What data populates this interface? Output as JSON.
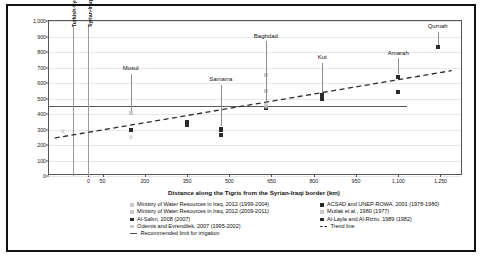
{
  "chart_data": {
    "type": "scatter",
    "title": "",
    "xlabel": "Distance along the Tigris from the Syrian-Iraqi border (km)",
    "ylabel": "TDS (ppm)",
    "xlim": [
      -140,
      1330
    ],
    "ylim": [
      0,
      1000
    ],
    "xticks": [
      0,
      50,
      200,
      350,
      500,
      650,
      800,
      950,
      1100,
      1250
    ],
    "xticklabels": [
      "0",
      "50",
      "200",
      "350",
      "500",
      "650",
      "800",
      "950",
      "1,100",
      "1,250"
    ],
    "yticks": [
      0,
      100,
      200,
      300,
      400,
      500,
      600,
      700,
      800,
      900,
      1000
    ],
    "yticklabels": [
      "0",
      "100",
      "200",
      "300",
      "400",
      "500",
      "600",
      "700",
      "800",
      "900",
      "1,000"
    ],
    "grid": true,
    "legend_position": "below-axis",
    "series": [
      {
        "name": "Ministry of Water Resources in Iraq, 2012 (1999-2004)",
        "marker": "square",
        "color": "#c9c9c9",
        "points": [
          {
            "x": 150,
            "y": 405
          },
          {
            "x": 630,
            "y": 550
          },
          {
            "x": 630,
            "y": 650
          }
        ]
      },
      {
        "name": "Ministry of Water Resources in Iraq, 2012 (2009-2011)",
        "marker": "square",
        "color": "#d8d8d8",
        "points": [
          {
            "x": -90,
            "y": 288
          },
          {
            "x": 150,
            "y": 250
          }
        ]
      },
      {
        "name": "Al-Salim, 2008 (2007)",
        "marker": "square",
        "color": "#2b2b2b",
        "points": [
          {
            "x": 150,
            "y": 300
          },
          {
            "x": 350,
            "y": 330
          },
          {
            "x": 470,
            "y": 300
          },
          {
            "x": 470,
            "y": 265
          },
          {
            "x": 630,
            "y": 455
          },
          {
            "x": 630,
            "y": 440
          },
          {
            "x": 830,
            "y": 520
          },
          {
            "x": 830,
            "y": 500
          },
          {
            "x": 1100,
            "y": 640
          },
          {
            "x": 1100,
            "y": 540
          },
          {
            "x": 1240,
            "y": 830
          }
        ]
      },
      {
        "name": "Odemis and Evrendilek, 2007 (1995-2002)",
        "marker": "square",
        "color": "#cfcfcf",
        "points": [
          {
            "x": 630,
            "y": 460
          }
        ]
      },
      {
        "name": "ACSAD and UNEP-ROWA, 2001 (1978-1980)",
        "marker": "square",
        "color": "#2b2b2b",
        "points": [
          {
            "x": 350,
            "y": 350
          },
          {
            "x": 830,
            "y": 515
          }
        ]
      },
      {
        "name": "Mutlak et al., 1980 (1977)",
        "marker": "square",
        "color": "#b5b5b5",
        "points": [
          {
            "x": 630,
            "y": 445
          }
        ]
      },
      {
        "name": "Al-Layla and Al-Rizzo, 1989 (1982)",
        "marker": "square",
        "color": "#2b2b2b",
        "points": [
          {
            "x": 150,
            "y": 295
          },
          {
            "x": 470,
            "y": 305
          }
        ]
      }
    ],
    "trend_line": {
      "name": "Trend line",
      "style": "dashed",
      "color": "#2b2b2b",
      "x_start": -120,
      "y_start": 245,
      "x_end": 1290,
      "y_end": 680
    },
    "reference_line": {
      "name": "Recommended limit for irrigation",
      "style": "solid",
      "color": "#5a5a5a",
      "y": 450,
      "x_start": -140,
      "x_end": 1130
    },
    "vertical_markers": [
      {
        "label": "Turkish-Syrian Border",
        "x": -55
      },
      {
        "label": "Syrian-Iraqi Border",
        "x": 0
      }
    ],
    "city_annotations": [
      {
        "label": "Mosul",
        "x": 150,
        "label_y": 690,
        "line_top_y": 660,
        "line_bottom_y": 420
      },
      {
        "label": "Samarra",
        "x": 470,
        "label_y": 620,
        "line_top_y": 590,
        "line_bottom_y": 320
      },
      {
        "label": "Baghdad",
        "x": 630,
        "label_y": 900,
        "line_top_y": 870,
        "line_bottom_y": 470
      },
      {
        "label": "Kut",
        "x": 830,
        "label_y": 760,
        "line_top_y": 730,
        "line_bottom_y": 535
      },
      {
        "label": "Amarah",
        "x": 1100,
        "label_y": 790,
        "line_top_y": 760,
        "line_bottom_y": 655
      },
      {
        "label": "Qurnah",
        "x": 1240,
        "label_y": 960,
        "line_top_y": 930,
        "line_bottom_y": 845
      }
    ]
  },
  "legend": {
    "left_column": [
      {
        "label": "Ministry of Water Resources in Iraq, 2012 (1999-2004)",
        "mark": "square-light"
      },
      {
        "label": "Ministry of Water Resources in Iraq, 2012 (2009-2011)",
        "mark": "square-light"
      },
      {
        "label": "Al-Salim, 2008 (2007)",
        "mark": "square-dark"
      },
      {
        "label": "Odemis and Evrendilek, 2007 (1995-2002)",
        "mark": "square-light"
      }
    ],
    "right_column": [
      {
        "label": "ACSAD and UNEP-ROWA, 2001 (1978-1980)",
        "mark": "square-dark"
      },
      {
        "label": "Mutlak et al., 1980 (1977)",
        "mark": "square-light"
      },
      {
        "label": "Al-Layla and Al-Rizzo, 1989 (1982)",
        "mark": "square-dark"
      },
      {
        "label": "Trend line",
        "mark": "dashed-line"
      }
    ],
    "full_width_item": {
      "label": "Recommended limit for irrigation",
      "mark": "solid-line"
    }
  }
}
